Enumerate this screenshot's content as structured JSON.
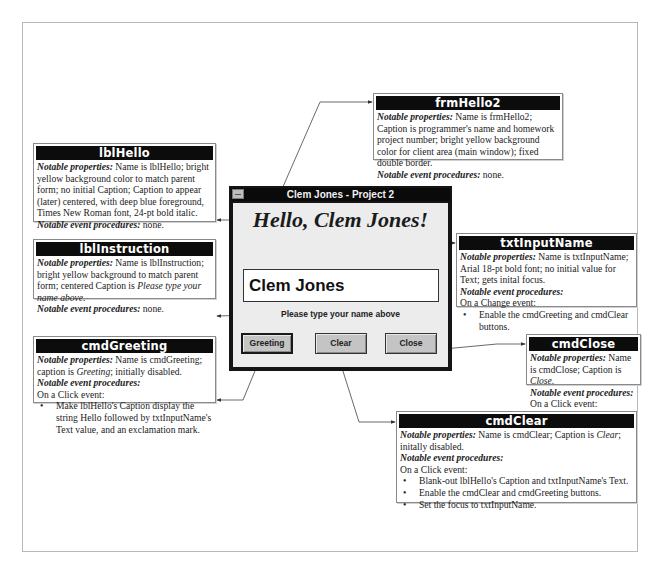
{
  "form": {
    "title": "Clem Jones - Project 2",
    "hello_caption": "Hello, Clem Jones!",
    "input_value": "Clem Jones",
    "instruction": "Please type your name above",
    "buttons": {
      "greeting": "Greeting",
      "clear": "Clear",
      "close": "Close"
    }
  },
  "callouts": {
    "frmHello2": {
      "title": "frmHello2",
      "props_label": "Notable properties:",
      "props_text": " Name is frmHello2; Caption is programmer's name and homework project number; bright yellow background color for client area (main window); fixed double border.",
      "events_label": "Notable event procedures:",
      "events_text": " none."
    },
    "lblHello": {
      "title": "lblHello",
      "props_label": "Notable properties:",
      "props_text": " Name is lblHello; bright yellow background color to match parent form; no initial Caption; Caption to appear (later) centered, with deep blue foreground, Times New Roman font, 24-pt bold italic.",
      "events_label": "Notable event procedures:",
      "events_text": " none."
    },
    "lblInstruction": {
      "title": "lblInstruction",
      "props_label": "Notable properties:",
      "props_text": " Name is lblInstruction; bright yellow background to match parent form; centered Caption is ",
      "props_italic": "Please type your name above",
      "props_end": ".",
      "events_label": "Notable event procedures:",
      "events_text": " none."
    },
    "cmdGreeting": {
      "title": "cmdGreeting",
      "props_label": "Notable properties:",
      "props_text": " Name is cmdGreeting; caption is ",
      "props_italic": "Greeting",
      "props_end": "; initially disabled.",
      "events_label": "Notable event procedures:",
      "event_trigger": "On a Click event:",
      "bullets": [
        "Make lblHello's Caption display the string Hello followed by txtInputName's Text value, and an exclamation mark."
      ]
    },
    "txtInputName": {
      "title": "txtInputName",
      "props_label": "Notable properties:",
      "props_text": " Name is txtInputName; Arial 18-pt bold font; no initial value for Text; gets inital focus.",
      "events_label": "Notable event procedures:",
      "event_trigger": "On a Change event:",
      "bullets": [
        "Enable the cmdGreeting and cmdClear buttons."
      ]
    },
    "cmdClose": {
      "title": "cmdClose",
      "props_label": "Notable properties:",
      "props_text": " Name is cmdClose; Caption is ",
      "props_italic": "Close",
      "props_end": ".",
      "events_label": "Notable event procedures:",
      "event_trigger": "On a Click event:",
      "bullets": [
        "End the program."
      ]
    },
    "cmdClear": {
      "title": "cmdClear",
      "props_label": "Notable properties:",
      "props_text": " Name is cmdClear; Caption is ",
      "props_italic": "Clear",
      "props_end": "; initally disabled.",
      "events_label": "Notable event procedures:",
      "event_trigger": "On a Click event:",
      "bullets": [
        "Blank-out lblHello's Caption and txtInputName's Text.",
        "Enable the cmdClear and cmdGreeting buttons.",
        "Set the focus to txtInputName."
      ]
    }
  }
}
